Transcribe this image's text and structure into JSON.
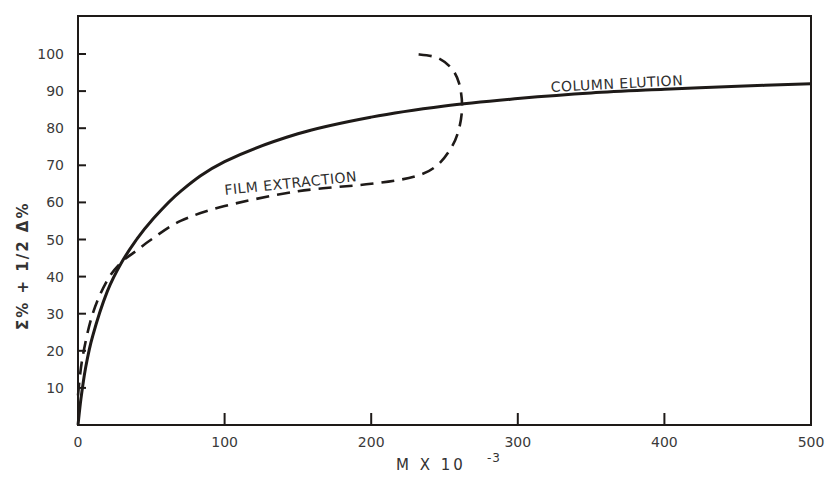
{
  "chart_data": {
    "type": "line",
    "title": "",
    "xlabel": "M X 10^-3",
    "xlabel_main": "M  X  10",
    "xlabel_exp": "-3",
    "ylabel": "Σ% + 1/2 Δ%",
    "xlim": [
      0,
      500
    ],
    "ylim": [
      0,
      110
    ],
    "grid": false,
    "legend_position": "inline curve labels",
    "x_ticks": [
      0,
      100,
      200,
      300,
      400,
      500
    ],
    "y_ticks": [
      10,
      20,
      30,
      40,
      50,
      60,
      70,
      80,
      90,
      100
    ],
    "series": [
      {
        "name": "COLUMN ELUTION",
        "style": "solid",
        "x": [
          0,
          2,
          5,
          10,
          20,
          30,
          40,
          50,
          70,
          100,
          150,
          200,
          250,
          300,
          350,
          400,
          450,
          500
        ],
        "y": [
          0,
          7,
          15,
          24,
          36,
          44,
          50,
          55,
          63,
          71,
          78.5,
          83,
          86,
          88,
          89.5,
          90.5,
          91.3,
          92
        ]
      },
      {
        "name": "FILM EXTRACTION",
        "style": "dashed",
        "x": [
          0,
          3,
          10,
          20,
          30,
          40,
          50,
          70,
          100,
          150,
          200,
          230,
          245,
          255,
          260,
          262,
          260,
          255,
          245,
          230
        ],
        "y": [
          8,
          18,
          30,
          39,
          44,
          47,
          50,
          55,
          59,
          63,
          65,
          67,
          70,
          75,
          80,
          86,
          92,
          96,
          99,
          100
        ]
      }
    ],
    "annotations": [
      {
        "text": "COLUMN ELUTION",
        "x": 330,
        "y": 91
      },
      {
        "text": "FILM EXTRACTION",
        "x": 100,
        "y": 64
      }
    ]
  },
  "labels": {
    "x_axis_main": "M  X  10",
    "x_axis_exp": "-3",
    "y_axis": "Σ%  +  1/2  Δ%",
    "column_elution": "COLUMN ELUTION",
    "film_extraction": "FILM EXTRACTION",
    "x_tick_labels": [
      "0",
      "100",
      "200",
      "300",
      "400",
      "500"
    ],
    "y_tick_labels": [
      "10",
      "20",
      "30",
      "40",
      "50",
      "60",
      "70",
      "80",
      "90",
      "100"
    ]
  },
  "colors": {
    "ink": "#1e1a18",
    "text": "#3a3a3a",
    "background": "#ffffff"
  }
}
